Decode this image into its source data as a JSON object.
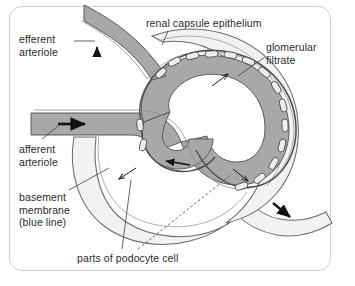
{
  "figure": {
    "background_color": "#ffffff",
    "frame_color": "#cfcfcf",
    "capillary_fill_color": "#a8a8a8",
    "filtrate_fill_color": "#f2f2f2",
    "outline_color": "#555555",
    "basement_line_color": "#777777",
    "arrow_color": "#111111",
    "text_color": "#2b2b2b"
  },
  "labels": {
    "efferent_arteriole": {
      "line1": "efferent",
      "line2": "arteriole"
    },
    "afferent_arteriole": {
      "line1": "afferent",
      "line2": "arteriole"
    },
    "basement_membrane": {
      "line1": "basement",
      "line2": "membrane",
      "line3": "(blue line)"
    },
    "renal_capsule_epithelium": "renal capsule epithelium",
    "glomerular_filtrate": {
      "line1": "glomerular",
      "line2": "filtrate"
    },
    "podocyte": "parts of podocyte cell"
  },
  "flow_arrows": [
    {
      "name": "afferent-inflow-arrow",
      "direction": "right"
    },
    {
      "name": "efferent-outflow-arrow",
      "direction": "up"
    },
    {
      "name": "capillary-coil-arrow",
      "direction": "left"
    },
    {
      "name": "filtrate-outflow-arrow",
      "direction": "down-right"
    },
    {
      "name": "filtration-arrow-upper",
      "direction": "up-right"
    },
    {
      "name": "filtration-arrow-lower-left",
      "direction": "down-left"
    },
    {
      "name": "filtration-arrow-lower-right",
      "direction": "down-right"
    }
  ],
  "podocyte_count": 16
}
